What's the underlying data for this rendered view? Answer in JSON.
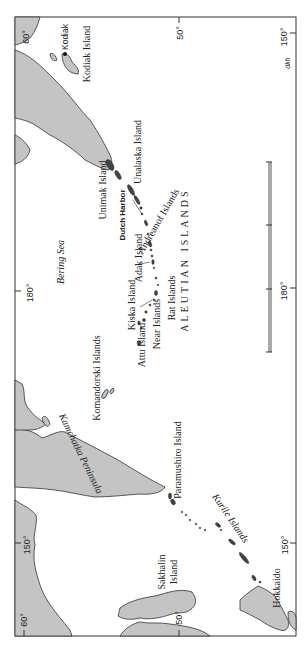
{
  "map": {
    "orientation": "rotated 90° counter-clockwise",
    "land_color": "#c4c4c4",
    "outline_color": "#333333",
    "graticule": {
      "left_edge": [
        "60°",
        "180°",
        "150°"
      ],
      "right_edge": [
        "50°",
        "150°",
        "50°",
        "150°"
      ],
      "top_left": "60°",
      "top_right": "150°",
      "bottom_left": "60°",
      "bottom_mid": "50°",
      "bottom_right": "150°"
    },
    "labels": {
      "kodiak": "Kodiak",
      "kodiak_island": "Kodiak Island",
      "unalaska_island": "Unalaska Island",
      "unimak_island": "Unimak Island",
      "dutch_harbor": "Dutch Harbor",
      "andreanof_islands": "Andreanof Islands",
      "adak_island": "Adak Island",
      "aleutian_islands": "ALEUTIAN ISLANDS",
      "rat_islands": "Rat Islands",
      "kiska_island": "Kiska Island",
      "near_islands": "Near Islands",
      "attu_island": "Attu Island",
      "bering_sea": "Bering Sea",
      "komandorski_islands": "Komandorski Islands",
      "kamchatka_peninsula": "Kamchatka Peninsula",
      "paramushiro_island": "Paramushiro Island",
      "kurile_islands": "Kurile Islands",
      "sakhalin_island_1": "Sakhalin",
      "sakhalin_island_2": "Island",
      "hokkaido": "Hokkaido",
      "credit": "dkh"
    },
    "degrees": {
      "d60": "60°",
      "d180": "180°",
      "d150": "150°",
      "d50": "50°"
    }
  }
}
